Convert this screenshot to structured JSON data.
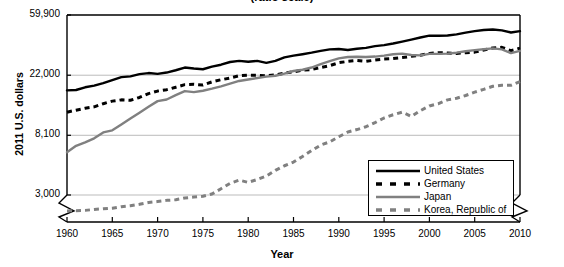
{
  "chart_data": {
    "type": "line",
    "title": "(ratio scale)",
    "xlabel": "Year",
    "ylabel": "2011 U.S. dollars",
    "scale": "log",
    "grid": true,
    "legend_position": "inside-bottom-right",
    "axis_break": true,
    "xlim": [
      1960,
      2010
    ],
    "ylim": [
      3000,
      59900
    ],
    "yticks": [
      3000,
      8100,
      22000,
      59900
    ],
    "ytick_labels": [
      "3,000",
      "8,100",
      "22,000",
      "59,900"
    ],
    "xticks": [
      1960,
      1965,
      1970,
      1975,
      1980,
      1985,
      1990,
      1995,
      2000,
      2005,
      2010
    ],
    "xtick_labels": [
      "1960",
      "1965",
      "1970",
      "1975",
      "1980",
      "1985",
      "1990",
      "1995",
      "2000",
      "2005",
      "2010"
    ],
    "x": [
      1960,
      1961,
      1962,
      1963,
      1964,
      1965,
      1966,
      1967,
      1968,
      1969,
      1970,
      1971,
      1972,
      1973,
      1974,
      1975,
      1976,
      1977,
      1978,
      1979,
      1980,
      1981,
      1982,
      1983,
      1984,
      1985,
      1986,
      1987,
      1988,
      1989,
      1990,
      1991,
      1992,
      1993,
      1994,
      1995,
      1996,
      1997,
      1998,
      1999,
      2000,
      2001,
      2002,
      2003,
      2004,
      2005,
      2006,
      2007,
      2008,
      2009,
      2010
    ],
    "series": [
      {
        "name": "United States",
        "color": "#000000",
        "style": "solid",
        "values": [
          17100,
          17200,
          18000,
          18500,
          19300,
          20300,
          21300,
          21600,
          22400,
          22800,
          22500,
          23000,
          23900,
          25000,
          24600,
          24300,
          25400,
          26200,
          27400,
          27900,
          27500,
          27900,
          27000,
          27900,
          29600,
          30500,
          31200,
          32000,
          33000,
          33800,
          34000,
          33500,
          34200,
          34700,
          35700,
          36300,
          37300,
          38500,
          39800,
          41200,
          42500,
          42400,
          42600,
          43400,
          44700,
          45800,
          46700,
          47100,
          46400,
          44800,
          45800
        ]
      },
      {
        "name": "Germany",
        "color": "#000000",
        "style": "dashed",
        "values": [
          11900,
          12300,
          12700,
          13000,
          13700,
          14300,
          14600,
          14500,
          15200,
          16200,
          16900,
          17300,
          18000,
          18800,
          18900,
          18700,
          19700,
          20400,
          21000,
          21800,
          22000,
          22000,
          21800,
          22100,
          22800,
          23300,
          23900,
          24200,
          25000,
          25800,
          27100,
          27700,
          28100,
          27700,
          28300,
          28800,
          29000,
          29500,
          30100,
          30700,
          31600,
          32000,
          31800,
          31600,
          32000,
          32300,
          33500,
          34600,
          35000,
          33100,
          34500
        ]
      },
      {
        "name": "Japan",
        "color": "#808080",
        "style": "solid",
        "values": [
          6100,
          6800,
          7200,
          7700,
          8500,
          8800,
          9700,
          10700,
          11800,
          13000,
          14300,
          14700,
          15800,
          16900,
          16600,
          17000,
          17600,
          18300,
          19100,
          20000,
          20500,
          21000,
          21500,
          21800,
          22600,
          23600,
          24100,
          25000,
          26500,
          27800,
          29100,
          29800,
          29900,
          29800,
          30000,
          30500,
          31200,
          31500,
          30800,
          30600,
          31400,
          31400,
          31500,
          32000,
          32800,
          33400,
          33900,
          34400,
          33800,
          31800,
          33000
        ]
      },
      {
        "name": "Korea, Republic of",
        "color": "#808080",
        "style": "dashed",
        "values": [
          1100,
          1120,
          1140,
          1210,
          1260,
          1310,
          1440,
          1520,
          1670,
          1870,
          1990,
          2140,
          2220,
          2490,
          2630,
          2760,
          3050,
          3330,
          3640,
          3840,
          3700,
          3880,
          4110,
          4520,
          4880,
          5190,
          5700,
          6280,
          6880,
          7260,
          7900,
          8550,
          8910,
          9340,
          10000,
          10800,
          11400,
          11900,
          11100,
          12200,
          13200,
          13700,
          14600,
          15000,
          15700,
          16600,
          17400,
          18300,
          18600,
          18600,
          19800
        ]
      }
    ]
  },
  "legend": {
    "items": [
      {
        "label": "United States"
      },
      {
        "label": "Germany"
      },
      {
        "label": "Japan"
      },
      {
        "label": "Korea, Republic of"
      }
    ]
  },
  "colors": {
    "series_black": "#000000",
    "series_gray": "#808080",
    "gridline": "#aaaaaa",
    "axis": "#000000",
    "background": "#ffffff"
  }
}
